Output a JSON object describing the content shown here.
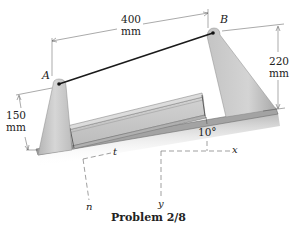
{
  "figure": {
    "caption": "Problem 2/8",
    "points": {
      "A": "A",
      "B": "B"
    },
    "dimensions": {
      "horizontal": {
        "value": "400",
        "unit": "mm"
      },
      "right_height": {
        "value": "220",
        "unit": "mm"
      },
      "left_height": {
        "value": "150",
        "unit": "mm"
      }
    },
    "angle": "10°",
    "axes": {
      "global": {
        "x": "x",
        "y": "y"
      },
      "local": {
        "t": "t",
        "n": "n"
      }
    },
    "colors": {
      "support": "#c9c9c9",
      "support_shadow": "#a8a8a8",
      "base": "#b8b8b8",
      "beam": "#bdbdbd",
      "cable": "#1a1a1a",
      "dim_line": "#555555"
    }
  }
}
